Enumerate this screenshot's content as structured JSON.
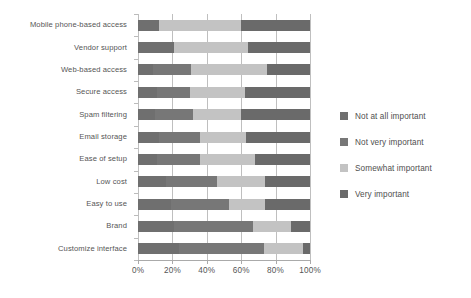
{
  "chart_data": {
    "type": "bar",
    "orientation": "horizontal",
    "stacked": true,
    "normalized": true,
    "title": "",
    "subtitle": "",
    "xlabel": "",
    "ylabel": "",
    "xlim": [
      0,
      100
    ],
    "xticks": [
      0,
      20,
      40,
      60,
      80,
      100
    ],
    "xtick_labels": [
      "0%",
      "20%",
      "40%",
      "60%",
      "80%",
      "100%"
    ],
    "grid": "vertical",
    "legend_position": "right",
    "categories": [
      "Mobile phone-based access",
      "Vendor support",
      "Web-based access",
      "Secure access",
      "Spam filtering",
      "Email storage",
      "Ease of setup",
      "Low cost",
      "Easy to use",
      "Brand",
      "Customize interface"
    ],
    "series": [
      {
        "name": "Not at all important",
        "color": "#6f6f6f",
        "values": [
          12,
          21,
          9,
          11,
          10,
          12,
          11,
          16,
          19,
          21,
          24
        ]
      },
      {
        "name": "Not very important",
        "color": "#777777",
        "values": [
          0,
          0,
          22,
          19,
          22,
          24,
          25,
          30,
          34,
          46,
          49
        ]
      },
      {
        "name": "Somewhat important",
        "color": "#c3c3c3",
        "values": [
          48,
          43,
          44,
          32,
          28,
          27,
          32,
          28,
          21,
          22,
          23
        ]
      },
      {
        "name": "Very important",
        "color": "#6a6a6a",
        "values": [
          40,
          36,
          25,
          38,
          40,
          37,
          32,
          26,
          26,
          11,
          4
        ]
      }
    ],
    "cumulative_boundaries": [
      [
        12,
        12,
        60,
        100
      ],
      [
        21,
        21,
        64,
        100
      ],
      [
        9,
        31,
        75,
        100
      ],
      [
        11,
        30,
        62,
        100
      ],
      [
        10,
        32,
        60,
        100
      ],
      [
        12,
        36,
        63,
        100
      ],
      [
        11,
        36,
        68,
        100
      ],
      [
        16,
        46,
        74,
        100
      ],
      [
        19,
        53,
        74,
        100
      ],
      [
        21,
        67,
        89,
        100
      ],
      [
        24,
        73,
        96,
        100
      ]
    ]
  },
  "legend": {
    "items": [
      {
        "label": "Not at all important",
        "color": "#6f6f6f"
      },
      {
        "label": "Not very important",
        "color": "#777777"
      },
      {
        "label": "Somewhat important",
        "color": "#c3c3c3"
      },
      {
        "label": "Very important",
        "color": "#6a6a6a"
      }
    ]
  },
  "axis": {
    "x_tick_labels": [
      "0%",
      "20%",
      "40%",
      "60%",
      "80%",
      "100%"
    ]
  },
  "colors": {
    "gridline": "#bfbfbf",
    "axis": "#aaaaaa",
    "text": "#555555",
    "background": "#ffffff"
  }
}
